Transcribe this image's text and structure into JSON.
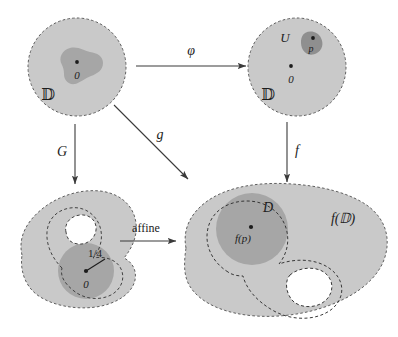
{
  "figure": {
    "kind": "commutative-diagram",
    "background_color": "#ffffff",
    "palette": {
      "region_light": "#c9c9c9",
      "region_dark": "#a9a9a9",
      "outline": "#6e6e6e",
      "ink": "#1c1c1c",
      "hole": "#ffffff"
    }
  },
  "panels": {
    "top_left": {
      "name": "unit-disk-source",
      "region_label": "D",
      "region_label_style": "blackboard",
      "center_point_label": "0",
      "inner_blob_name": "source-blob"
    },
    "top_right": {
      "name": "unit-disk-target",
      "region_label": "D",
      "region_label_style": "blackboard",
      "center_point_label": "0",
      "neighborhood_label": "U",
      "point_label": "p"
    },
    "bottom_left": {
      "name": "image-under-G",
      "radius_label": "1/4",
      "center_point_label": "0"
    },
    "bottom_right": {
      "name": "image-under-f",
      "region_label": "f(D)",
      "region_label_style": "blackboard-arg",
      "disk_label": "D",
      "point_label": "f(p)"
    }
  },
  "arrows": [
    {
      "id": "phi",
      "label": "φ",
      "from": "top_left",
      "to": "top_right",
      "direction": "right",
      "style": "italic"
    },
    {
      "id": "G",
      "label": "G",
      "from": "top_left",
      "to": "bottom_left",
      "direction": "down",
      "style": "italic"
    },
    {
      "id": "g",
      "label": "g",
      "from": "top_left",
      "to": "bottom_right",
      "direction": "diagonal-down-right",
      "style": "italic"
    },
    {
      "id": "f",
      "label": "f",
      "from": "top_right",
      "to": "bottom_right",
      "direction": "down",
      "style": "italic"
    },
    {
      "id": "affine",
      "label": "affine",
      "from": "bottom_left",
      "to": "bottom_right",
      "direction": "right",
      "style": "roman"
    }
  ]
}
